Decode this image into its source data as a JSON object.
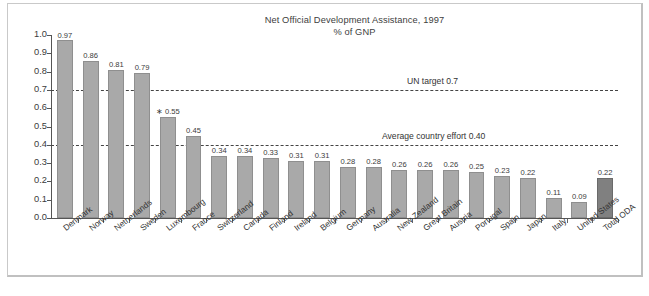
{
  "chart_data": {
    "type": "bar",
    "title": "Net Official Development Assistance, 1997",
    "subtitle": "% of GNP",
    "xlabel": "",
    "ylabel": "",
    "ylim": [
      0.0,
      1.0
    ],
    "ytick_labels": [
      "1.0",
      "0.9",
      "0.8",
      "0.7",
      "0.6",
      "0.5",
      "0.4",
      "0.3",
      "0.2",
      "0.1",
      "0.0"
    ],
    "ytick_values": [
      1.0,
      0.9,
      0.8,
      0.7,
      0.6,
      0.5,
      0.4,
      0.3,
      0.2,
      0.1,
      0.0
    ],
    "grid": false,
    "legend": "none",
    "categories": [
      "Denmark",
      "Norway",
      "Netherlands",
      "Sweden",
      "Luxembourg",
      "France",
      "Switzerland",
      "Canada",
      "Finland",
      "Ireland",
      "Belgium",
      "Germany",
      "Australia",
      "New Zealand",
      "Great Britain",
      "Austria",
      "Portugal",
      "Spain",
      "Japan",
      "Italy",
      "United States",
      "Total ODA"
    ],
    "values": [
      0.97,
      0.86,
      0.81,
      0.79,
      0.55,
      0.45,
      0.34,
      0.34,
      0.33,
      0.31,
      0.31,
      0.28,
      0.28,
      0.26,
      0.26,
      0.26,
      0.25,
      0.23,
      0.22,
      0.11,
      0.09,
      0.22
    ],
    "value_labels": [
      "0.97",
      "0.86",
      "0.81",
      "0.79",
      "0.55",
      "0.45",
      "0.34",
      "0.34",
      "0.33",
      "0.31",
      "0.31",
      "0.28",
      "0.28",
      "0.26",
      "0.26",
      "0.26",
      "0.25",
      "0.23",
      "0.22",
      "0.11",
      "0.09",
      "0.22"
    ],
    "value_label_prefixes": [
      "",
      "",
      "",
      "",
      "∗ ",
      "",
      "",
      "",
      "",
      "",
      "",
      "",
      "",
      "",
      "",
      "",
      "",
      "",
      "",
      "",
      "",
      ""
    ],
    "highlight_index": 21,
    "bar_color": "#a9a9a9",
    "highlight_color": "#808080",
    "reference_lines": [
      {
        "value": 0.7,
        "label": "UN target 0.7"
      },
      {
        "value": 0.4,
        "label": "Average country effort 0.40"
      }
    ]
  }
}
